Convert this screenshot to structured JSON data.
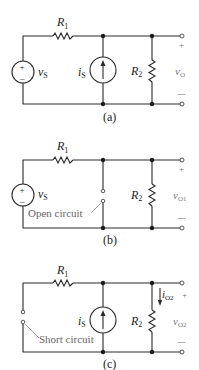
{
  "figure": {
    "panels": [
      {
        "id": "a",
        "caption": "(a)",
        "labels": {
          "r1": "R",
          "r1_sub": "1",
          "r2": "R",
          "r2_sub": "2",
          "vs": "v",
          "vs_sub": "S",
          "is": "i",
          "is_sub": "S",
          "vo": "v",
          "vo_sub": "O",
          "plus": "+",
          "minus": "—"
        }
      },
      {
        "id": "b",
        "caption": "(b)",
        "annotation": "Open circuit",
        "labels": {
          "r1": "R",
          "r1_sub": "1",
          "r2": "R",
          "r2_sub": "2",
          "vs": "v",
          "vs_sub": "S",
          "vo": "v",
          "vo_sub": "O1",
          "plus": "+",
          "minus": "—"
        }
      },
      {
        "id": "c",
        "caption": "(c)",
        "annotation": "Short circuit",
        "labels": {
          "r1": "R",
          "r1_sub": "1",
          "r2": "R",
          "r2_sub": "2",
          "is": "i",
          "is_sub": "S",
          "io": "i",
          "io_sub": "O2",
          "vo": "v",
          "vo_sub": "O2",
          "plus": "+",
          "minus": "—"
        }
      }
    ],
    "source_symbols": {
      "plus": "+",
      "minus": "–"
    }
  }
}
